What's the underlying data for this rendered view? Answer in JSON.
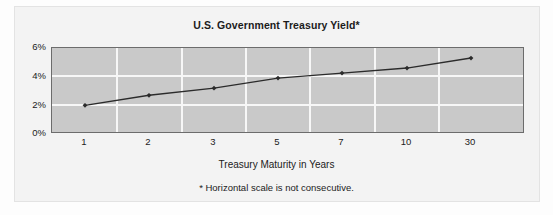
{
  "chart_data": {
    "type": "line",
    "title": "U.S. Government Treasury Yield*",
    "xlabel": "Treasury Maturity in Years",
    "ylabel": "",
    "footnote": "* Horizontal scale is not consecutive.",
    "categories": [
      "1",
      "2",
      "3",
      "5",
      "7",
      "10",
      "30"
    ],
    "values": [
      2.0,
      2.7,
      3.2,
      3.9,
      4.25,
      4.6,
      5.3
    ],
    "ytick_labels": [
      "6%",
      "4%",
      "2%",
      "0%"
    ],
    "ytick_values": [
      6,
      4,
      2,
      0
    ],
    "ylim": [
      0,
      6
    ],
    "grid": "both",
    "legend": "none",
    "series_color": "#2b2b2b",
    "plot_background": "#c9c9c9",
    "gridline_color": "#f7f7f7",
    "marker": "diamond"
  },
  "figure": {
    "background": "#f3f3f3",
    "border_color": "#e3e3e3"
  }
}
